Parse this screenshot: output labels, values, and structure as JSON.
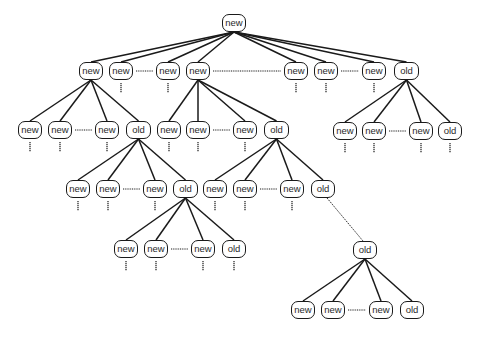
{
  "diagram": {
    "type": "tree",
    "colors": {
      "line": "#1a1a1a",
      "node_fill": "#ffffff",
      "text": "#2a2a2a"
    },
    "nodes": [
      {
        "id": "root",
        "label": "new",
        "x": 222,
        "y": 14,
        "w": 24
      },
      {
        "id": "a1",
        "label": "new",
        "x": 79,
        "y": 62,
        "w": 24
      },
      {
        "id": "a2",
        "label": "new",
        "x": 109,
        "y": 62,
        "w": 24
      },
      {
        "id": "a3",
        "label": "new",
        "x": 156,
        "y": 62,
        "w": 24
      },
      {
        "id": "a4",
        "label": "new",
        "x": 186,
        "y": 62,
        "w": 24
      },
      {
        "id": "a5",
        "label": "new",
        "x": 284,
        "y": 62,
        "w": 24
      },
      {
        "id": "a6",
        "label": "new",
        "x": 314,
        "y": 62,
        "w": 24
      },
      {
        "id": "a7",
        "label": "new",
        "x": 362,
        "y": 62,
        "w": 24
      },
      {
        "id": "a8",
        "label": "old",
        "x": 394,
        "y": 62,
        "w": 25
      },
      {
        "id": "b1",
        "label": "new",
        "x": 18,
        "y": 121,
        "w": 24
      },
      {
        "id": "b2",
        "label": "new",
        "x": 48,
        "y": 121,
        "w": 24
      },
      {
        "id": "b3",
        "label": "new",
        "x": 95,
        "y": 121,
        "w": 24
      },
      {
        "id": "b4",
        "label": "old",
        "x": 126,
        "y": 121,
        "w": 25
      },
      {
        "id": "c1",
        "label": "new",
        "x": 157,
        "y": 121,
        "w": 24
      },
      {
        "id": "c2",
        "label": "new",
        "x": 186,
        "y": 121,
        "w": 24
      },
      {
        "id": "c3",
        "label": "new",
        "x": 233,
        "y": 121,
        "w": 24
      },
      {
        "id": "c4",
        "label": "old",
        "x": 264,
        "y": 121,
        "w": 25
      },
      {
        "id": "d1",
        "label": "new",
        "x": 333,
        "y": 122,
        "w": 24
      },
      {
        "id": "d2",
        "label": "new",
        "x": 362,
        "y": 122,
        "w": 24
      },
      {
        "id": "d3",
        "label": "new",
        "x": 409,
        "y": 122,
        "w": 24
      },
      {
        "id": "d4",
        "label": "old",
        "x": 438,
        "y": 122,
        "w": 24
      },
      {
        "id": "e1",
        "label": "new",
        "x": 66,
        "y": 180,
        "w": 24
      },
      {
        "id": "e2",
        "label": "new",
        "x": 96,
        "y": 180,
        "w": 24
      },
      {
        "id": "e3",
        "label": "new",
        "x": 143,
        "y": 180,
        "w": 24
      },
      {
        "id": "e4",
        "label": "old",
        "x": 173,
        "y": 180,
        "w": 25
      },
      {
        "id": "f1",
        "label": "new",
        "x": 203,
        "y": 180,
        "w": 24
      },
      {
        "id": "f2",
        "label": "new",
        "x": 233,
        "y": 180,
        "w": 24
      },
      {
        "id": "f3",
        "label": "new",
        "x": 280,
        "y": 180,
        "w": 24
      },
      {
        "id": "f4",
        "label": "old",
        "x": 311,
        "y": 180,
        "w": 24
      },
      {
        "id": "g1",
        "label": "new",
        "x": 114,
        "y": 240,
        "w": 24
      },
      {
        "id": "g2",
        "label": "new",
        "x": 144,
        "y": 240,
        "w": 24
      },
      {
        "id": "g3",
        "label": "new",
        "x": 191,
        "y": 240,
        "w": 24
      },
      {
        "id": "g4",
        "label": "old",
        "x": 222,
        "y": 240,
        "w": 24
      },
      {
        "id": "h0",
        "label": "old",
        "x": 353,
        "y": 241,
        "w": 24
      },
      {
        "id": "i1",
        "label": "new",
        "x": 291,
        "y": 301,
        "w": 24
      },
      {
        "id": "i2",
        "label": "new",
        "x": 321,
        "y": 301,
        "w": 24
      },
      {
        "id": "i3",
        "label": "new",
        "x": 369,
        "y": 301,
        "w": 24
      },
      {
        "id": "i4",
        "label": "old",
        "x": 400,
        "y": 301,
        "w": 24
      }
    ],
    "edges": [
      [
        "root",
        "a1"
      ],
      [
        "root",
        "a2"
      ],
      [
        "root",
        "a3"
      ],
      [
        "root",
        "a4"
      ],
      [
        "root",
        "a5"
      ],
      [
        "root",
        "a6"
      ],
      [
        "root",
        "a7"
      ],
      [
        "root",
        "a8"
      ],
      [
        "a1",
        "b1"
      ],
      [
        "a1",
        "b2"
      ],
      [
        "a1",
        "b3"
      ],
      [
        "a1",
        "b4"
      ],
      [
        "a4",
        "c1"
      ],
      [
        "a4",
        "c2"
      ],
      [
        "a4",
        "c3"
      ],
      [
        "a4",
        "c4"
      ],
      [
        "a8",
        "d1"
      ],
      [
        "a8",
        "d2"
      ],
      [
        "a8",
        "d3"
      ],
      [
        "a8",
        "d4"
      ],
      [
        "b4",
        "e1"
      ],
      [
        "b4",
        "e2"
      ],
      [
        "b4",
        "e3"
      ],
      [
        "b4",
        "e4"
      ],
      [
        "c4",
        "f1"
      ],
      [
        "c4",
        "f2"
      ],
      [
        "c4",
        "f3"
      ],
      [
        "c4",
        "f4"
      ],
      [
        "e4",
        "g1"
      ],
      [
        "e4",
        "g2"
      ],
      [
        "e4",
        "g3"
      ],
      [
        "e4",
        "g4"
      ],
      [
        "h0",
        "i1"
      ],
      [
        "h0",
        "i2"
      ],
      [
        "h0",
        "i3"
      ],
      [
        "h0",
        "i4"
      ]
    ],
    "dotted_edges": [
      [
        "f4",
        "h0"
      ]
    ],
    "sibling_ellipses": [
      [
        "a2",
        "a3"
      ],
      [
        "a4",
        "a5"
      ],
      [
        "a6",
        "a7"
      ],
      [
        "b2",
        "b3"
      ],
      [
        "c2",
        "c3"
      ],
      [
        "d2",
        "d3"
      ],
      [
        "e2",
        "e3"
      ],
      [
        "f2",
        "f3"
      ],
      [
        "g2",
        "g3"
      ],
      [
        "i2",
        "i3"
      ]
    ],
    "continuation_stubs": [
      "a2",
      "a3",
      "a5",
      "a6",
      "a7",
      "b1",
      "b2",
      "b3",
      "c1",
      "c2",
      "c3",
      "d1",
      "d2",
      "d3",
      "d4",
      "e1",
      "e2",
      "e3",
      "f1",
      "f2",
      "f3",
      "g1",
      "g2",
      "g3",
      "g4"
    ]
  }
}
